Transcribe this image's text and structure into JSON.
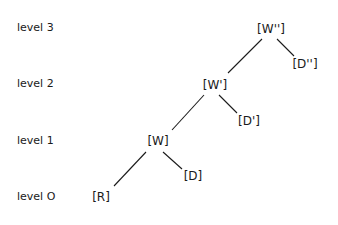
{
  "levels": [
    {
      "id": "level-3",
      "label": "level 3"
    },
    {
      "id": "level-2",
      "label": "level 2"
    },
    {
      "id": "level-1",
      "label": "level 1"
    },
    {
      "id": "level-0",
      "label": "level O"
    }
  ],
  "nodes": [
    {
      "id": "W2",
      "label": "[W'']",
      "level": 3
    },
    {
      "id": "D2",
      "label": "[D'']",
      "level": 3
    },
    {
      "id": "W1",
      "label": "[W']",
      "level": 2
    },
    {
      "id": "D1",
      "label": "[D']",
      "level": 2
    },
    {
      "id": "W0",
      "label": "[W]",
      "level": 1
    },
    {
      "id": "D0",
      "label": "[D]",
      "level": 1
    },
    {
      "id": "R",
      "label": "[R]",
      "level": 0
    }
  ],
  "edges": [
    {
      "from": "W2",
      "to": "W1"
    },
    {
      "from": "W2",
      "to": "D2"
    },
    {
      "from": "W1",
      "to": "W0"
    },
    {
      "from": "W1",
      "to": "D1"
    },
    {
      "from": "W0",
      "to": "R"
    },
    {
      "from": "W0",
      "to": "D0"
    }
  ]
}
